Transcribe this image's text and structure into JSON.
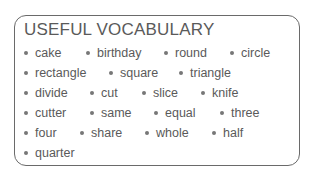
{
  "title": "USEFUL VOCABULARY",
  "rows": [
    [
      "cake",
      "birthday",
      "round",
      "circle"
    ],
    [
      "rectangle",
      "square",
      "triangle"
    ],
    [
      "divide",
      "cut",
      "slice",
      "knife"
    ],
    [
      "cutter",
      "same",
      "equal",
      "three"
    ],
    [
      "four",
      "share",
      "whole",
      "half"
    ],
    [
      "quarter"
    ]
  ]
}
